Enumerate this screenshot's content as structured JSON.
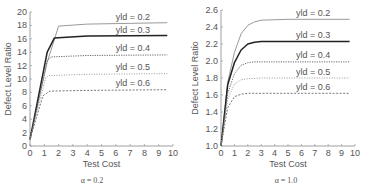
{
  "chart_data": [
    {
      "type": "line",
      "title": "",
      "caption": "α = 0.2",
      "xlabel": "Test Cost",
      "ylabel": "Defect Level Ratio",
      "xlim": [
        0,
        10
      ],
      "ylim": [
        0,
        20
      ],
      "xticks": [
        "0",
        "1",
        "2",
        "3",
        "4",
        "5",
        "6",
        "7",
        "8",
        "9",
        "10"
      ],
      "yticks": [
        "0",
        "2",
        "4",
        "6",
        "8",
        "10",
        "12",
        "14",
        "16",
        "18",
        "20"
      ],
      "grid": false,
      "legend": "inline labels",
      "series": [
        {
          "name": "yld = 0.2",
          "style": "solid-light",
          "x": [
            0,
            1.2,
            2.0,
            4,
            9.6
          ],
          "y": [
            1.0,
            12.5,
            17.9,
            18.2,
            18.4
          ]
        },
        {
          "name": "yld = 0.3",
          "style": "solid-dark",
          "x": [
            0,
            1.2,
            1.7,
            4,
            9.6
          ],
          "y": [
            1.0,
            14.0,
            16.1,
            16.4,
            16.5
          ]
        },
        {
          "name": "yld = 0.4",
          "style": "dotted",
          "x": [
            0,
            1.2,
            1.5,
            4,
            9.6
          ],
          "y": [
            1.0,
            12.8,
            13.3,
            13.5,
            13.6
          ]
        },
        {
          "name": "yld = 0.5",
          "style": "dotted-light",
          "x": [
            0,
            1.1,
            1.3,
            4,
            9.6
          ],
          "y": [
            1.0,
            10.2,
            10.5,
            10.7,
            10.8
          ]
        },
        {
          "name": "yld = 0.6",
          "style": "dashed",
          "x": [
            0,
            0.9,
            1.4,
            4,
            9.6
          ],
          "y": [
            1.0,
            7.5,
            8.2,
            8.3,
            8.4
          ]
        }
      ],
      "labels": [
        {
          "text": "yld = 0.2",
          "x": 6.0,
          "y": 18.8
        },
        {
          "text": "yld = 0.3",
          "x": 6.0,
          "y": 16.8
        },
        {
          "text": "yld = 0.4",
          "x": 6.0,
          "y": 14.2
        },
        {
          "text": "yld = 0.5",
          "x": 6.0,
          "y": 11.3
        },
        {
          "text": "yld = 0.6",
          "x": 6.0,
          "y": 8.9
        }
      ]
    },
    {
      "type": "line",
      "title": "",
      "caption": "α = 1.0",
      "xlabel": "Test Cost",
      "ylabel": "Defect Level Ratio",
      "xlim": [
        0,
        10
      ],
      "ylim": [
        1.0,
        2.6
      ],
      "xticks": [
        "0",
        "1",
        "2",
        "3",
        "4",
        "5",
        "6",
        "7",
        "8",
        "9",
        "10"
      ],
      "yticks": [
        "1.0",
        "1.2",
        "1.4",
        "1.6",
        "1.8",
        "2.0",
        "2.2",
        "2.4",
        "2.6"
      ],
      "grid": false,
      "legend": "inline labels",
      "series": [
        {
          "name": "yld = 0.2",
          "style": "solid-light",
          "x": [
            0,
            0.5,
            1,
            1.5,
            2,
            2.5,
            3,
            5,
            9.6
          ],
          "y": [
            1.0,
            1.75,
            2.1,
            2.32,
            2.42,
            2.46,
            2.48,
            2.49,
            2.49
          ]
        },
        {
          "name": "yld = 0.3",
          "style": "solid-dark",
          "x": [
            0,
            0.5,
            1,
            1.5,
            2,
            2.5,
            3,
            5,
            9.6
          ],
          "y": [
            1.0,
            1.72,
            1.98,
            2.13,
            2.2,
            2.22,
            2.23,
            2.23,
            2.23
          ]
        },
        {
          "name": "yld = 0.4",
          "style": "dotted",
          "x": [
            0,
            0.5,
            1,
            1.5,
            2,
            2.5,
            3,
            5,
            9.6
          ],
          "y": [
            1.0,
            1.62,
            1.85,
            1.95,
            1.98,
            1.99,
            1.99,
            1.99,
            1.99
          ]
        },
        {
          "name": "yld = 0.5",
          "style": "dotted-light",
          "x": [
            0,
            0.5,
            1,
            1.5,
            2,
            3,
            5,
            9.6
          ],
          "y": [
            1.0,
            1.55,
            1.73,
            1.78,
            1.79,
            1.8,
            1.8,
            1.8
          ]
        },
        {
          "name": "yld = 0.6",
          "style": "dashed",
          "x": [
            0,
            0.5,
            1,
            1.5,
            2,
            3,
            5,
            9.6
          ],
          "y": [
            1.0,
            1.45,
            1.58,
            1.61,
            1.62,
            1.62,
            1.62,
            1.62
          ]
        }
      ],
      "labels": [
        {
          "text": "yld = 0.2",
          "x": 5.6,
          "y": 2.53
        },
        {
          "text": "yld = 0.3",
          "x": 5.6,
          "y": 2.27
        },
        {
          "text": "yld = 0.4",
          "x": 5.6,
          "y": 2.03
        },
        {
          "text": "yld = 0.5",
          "x": 5.6,
          "y": 1.84
        },
        {
          "text": "yld = 0.6",
          "x": 5.6,
          "y": 1.66
        }
      ]
    }
  ]
}
